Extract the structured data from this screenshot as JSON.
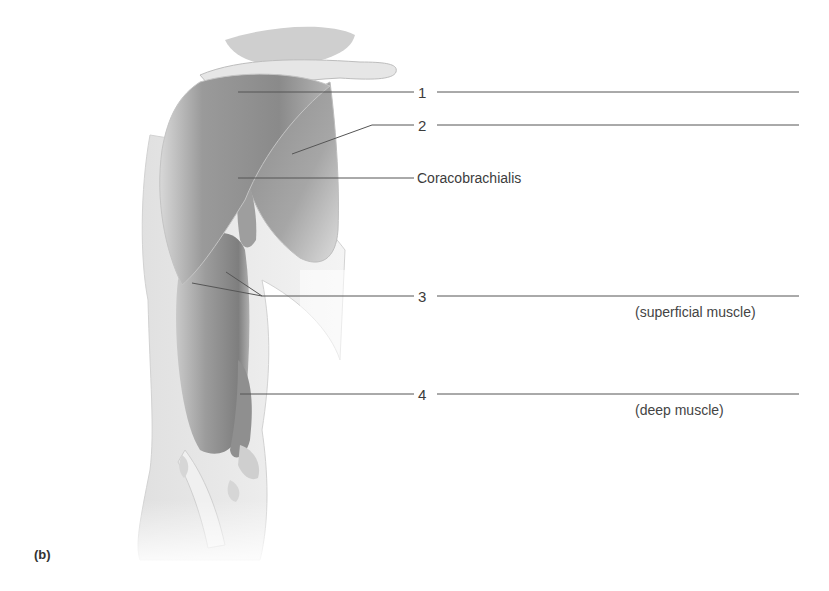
{
  "figure": {
    "panel_label": "(b)",
    "labels": [
      {
        "id": "1",
        "text": "1",
        "answer_blank": true
      },
      {
        "id": "2",
        "text": "2",
        "answer_blank": true
      },
      {
        "id": "coracobrachialis",
        "text": "Coracobrachialis",
        "answer_blank": false
      },
      {
        "id": "3",
        "text": "3",
        "answer_blank": true,
        "note": "(superficial muscle)"
      },
      {
        "id": "4",
        "text": "4",
        "answer_blank": true,
        "note": "(deep muscle)"
      }
    ]
  },
  "colors": {
    "leader_line": "#555555",
    "muscle_dark": "#8a8a8a",
    "muscle_light": "#c8c8c8",
    "skin": "#ececec"
  }
}
